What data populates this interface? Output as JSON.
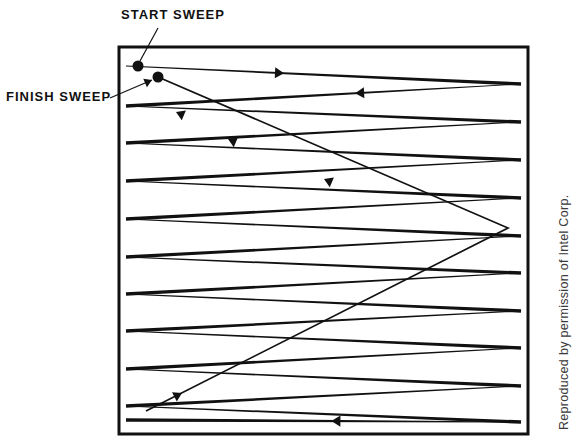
{
  "figure": {
    "background_color": "#ffffff",
    "ink_color": "#111111",
    "width": 578,
    "height": 447
  },
  "labels": {
    "start_sweep": "START SWEEP",
    "finish_sweep": "FINISH SWEEP",
    "credit": "Reproduced by permission of Intel Corp."
  },
  "frame": {
    "x": 119,
    "y": 47,
    "width": 409,
    "height": 387,
    "stroke_width": 3,
    "color": "#111111"
  },
  "markers": {
    "start_dot": {
      "cx": 138,
      "cy": 66,
      "r": 5.5,
      "color": "#111111"
    },
    "finish_dot": {
      "cx": 158,
      "cy": 77,
      "r": 5.5,
      "color": "#111111"
    }
  },
  "leaders": [
    {
      "name": "start-sweep-leader",
      "x1": 158,
      "y1": 28,
      "x2": 140,
      "y2": 61
    },
    {
      "name": "finish-sweep-leader",
      "x1": 110,
      "y1": 98,
      "x2": 152,
      "y2": 80
    }
  ],
  "chart_data": {
    "type": "line",
    "xlabel": "",
    "ylabel": "",
    "grid": false,
    "legend": null,
    "annotations": [
      {
        "text": "START SWEEP",
        "x": 138,
        "y": 66
      },
      {
        "text": "FINISH SWEEP",
        "x": 158,
        "y": 77
      }
    ],
    "scan_left_x": 126,
    "scan_right_x": 521,
    "scan_lines": [
      {
        "index": 1,
        "y_left": 66,
        "y_right": 84,
        "direction": "right",
        "arrow_t": 0.4
      },
      {
        "index": 2,
        "y_left": 106,
        "y_right": 122,
        "direction": "right",
        "arrow_t": 0.42
      },
      {
        "index": 3,
        "y_left": 143,
        "y_right": 160,
        "direction": "right",
        "arrow_t": 0.42
      },
      {
        "index": 4,
        "y_left": 181,
        "y_right": 198,
        "direction": "right",
        "arrow_t": 0.42
      },
      {
        "index": 5,
        "y_left": 219,
        "y_right": 236,
        "direction": "right",
        "arrow_t": 0.42
      },
      {
        "index": 6,
        "y_left": 257,
        "y_right": 273,
        "direction": "right",
        "arrow_t": 0.42
      },
      {
        "index": 7,
        "y_left": 294,
        "y_right": 311,
        "direction": "right",
        "arrow_t": 0.42
      },
      {
        "index": 8,
        "y_left": 331,
        "y_right": 348,
        "direction": "right",
        "arrow_t": 0.42
      },
      {
        "index": 9,
        "y_left": 369,
        "y_right": 386,
        "direction": "right",
        "arrow_t": 0.42
      },
      {
        "index": 10,
        "y_left": 406,
        "y_right": 422,
        "direction": "right",
        "arrow_t": 0.42
      }
    ],
    "flyback_lines": [
      {
        "index": 1,
        "y_right": 84,
        "y_left": 106,
        "direction": "left",
        "arrow_t": 0.42
      },
      {
        "index": 2,
        "y_right": 122,
        "y_left": 143,
        "direction": "left",
        "arrow_t": 0.42
      },
      {
        "index": 3,
        "y_right": 160,
        "y_left": 181,
        "direction": "left",
        "arrow_t": 0.42
      },
      {
        "index": 4,
        "y_right": 198,
        "y_left": 219,
        "direction": "left",
        "arrow_t": 0.42
      },
      {
        "index": 5,
        "y_right": 236,
        "y_left": 257,
        "direction": "left",
        "arrow_t": 0.42
      },
      {
        "index": 6,
        "y_right": 273,
        "y_left": 294,
        "direction": "left",
        "arrow_t": 0.42
      },
      {
        "index": 7,
        "y_right": 311,
        "y_left": 331,
        "direction": "left",
        "arrow_t": 0.42
      },
      {
        "index": 8,
        "y_right": 348,
        "y_left": 369,
        "direction": "left",
        "arrow_t": 0.42
      },
      {
        "index": 9,
        "y_right": 386,
        "y_left": 406,
        "direction": "left",
        "arrow_t": 0.42
      },
      {
        "index": 10,
        "y_right": 422,
        "y_left": 420,
        "direction": "left",
        "arrow_t": 0.48
      }
    ],
    "retrace": {
      "name": "vertical-retrace",
      "points": [
        [
          146,
          411
        ],
        [
          508,
          228
        ],
        [
          158,
          77
        ]
      ],
      "direction": "toward-finish-dot",
      "arrows": [
        {
          "x": 182,
          "y": 393,
          "angle": -27
        },
        {
          "x": 324,
          "y": 179,
          "angle": -157
        },
        {
          "x": 228,
          "y": 139,
          "angle": -157
        },
        {
          "x": 176,
          "y": 112,
          "angle": -157
        }
      ]
    }
  }
}
